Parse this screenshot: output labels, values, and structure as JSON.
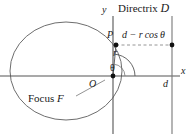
{
  "figure": {
    "type": "conic-section-polar-diagram",
    "labels": {
      "directrix": "Directrix",
      "directrix_symbol": "D",
      "y_axis": "y",
      "x_axis": "x",
      "point_p": "P",
      "distance_expression": "d − r cos θ",
      "radius": "r",
      "angle": "θ",
      "origin": "O",
      "focus": "Focus",
      "focus_symbol": "F",
      "directrix_distance": "d"
    },
    "colors": {
      "ink": "#1a1a1a",
      "curve": "#6e6e6e",
      "axis": "#555555",
      "dashed": "#8a8a8a",
      "background": "#ffffff"
    },
    "geometry": {
      "origin": {
        "x": 113,
        "y": 76
      },
      "point_p": {
        "x": 116,
        "y": 45
      },
      "directrix_x": 172,
      "directrix_foot": {
        "x": 172,
        "y": 45
      },
      "ellipse_center": {
        "x": 66,
        "y": 71
      },
      "ellipse_rx": 56,
      "ellipse_ry": 49
    }
  }
}
